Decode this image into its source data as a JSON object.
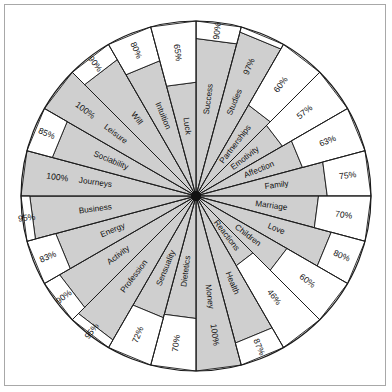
{
  "chart_data": {
    "type": "pie",
    "title": "",
    "subtitle": "",
    "xlabel": "",
    "ylabel": "",
    "grid": false,
    "legend": "none",
    "value_suffix": "%",
    "rmax": 100,
    "sector_count": 24,
    "start_angle_deg": -90,
    "direction": "clockwise",
    "fill_color": "#cfcfcf",
    "empty_color": "#ffffff",
    "line_color": "#1a1a1a",
    "categories": [
      "Success",
      "Studies",
      "Partnerships",
      "Emotivity",
      "Affection",
      "Family",
      "Marriage",
      "Love",
      "Children",
      "Reactions",
      "Health",
      "Money",
      "Dietetics",
      "Sensuality",
      "Profession",
      "Activity",
      "Energy",
      "Business",
      "Journeys",
      "Sociability",
      "Leisure",
      "Will",
      "Intuition",
      "Luck"
    ],
    "values": [
      90,
      97,
      60,
      57,
      63,
      75,
      70,
      80,
      60,
      46,
      87,
      100,
      70,
      72,
      95,
      90,
      83,
      95,
      100,
      85,
      100,
      90,
      80,
      65
    ],
    "labels": [
      "90%",
      "97%",
      "60%",
      "57%",
      "63%",
      "75%",
      "70%",
      "80%",
      "60%",
      "46%",
      "87%",
      "100%",
      "70%",
      "72%",
      "95%",
      "90%",
      "83%",
      "95%",
      "100%",
      "85%",
      "100%",
      "90%",
      "80%",
      "65%"
    ],
    "sectors": [
      {
        "name": "Success",
        "value": 90,
        "label": "90%"
      },
      {
        "name": "Studies",
        "value": 97,
        "label": "97%"
      },
      {
        "name": "Partnerships",
        "value": 60,
        "label": "60%"
      },
      {
        "name": "Emotivity",
        "value": 57,
        "label": "57%"
      },
      {
        "name": "Affection",
        "value": 63,
        "label": "63%"
      },
      {
        "name": "Family",
        "value": 75,
        "label": "75%"
      },
      {
        "name": "Marriage",
        "value": 70,
        "label": "70%"
      },
      {
        "name": "Love",
        "value": 80,
        "label": "80%"
      },
      {
        "name": "Children",
        "value": 60,
        "label": "60%"
      },
      {
        "name": "Reactions",
        "value": 46,
        "label": "46%"
      },
      {
        "name": "Health",
        "value": 87,
        "label": "87%"
      },
      {
        "name": "Money",
        "value": 100,
        "label": "100%"
      },
      {
        "name": "Dietetics",
        "value": 70,
        "label": "70%"
      },
      {
        "name": "Sensuality",
        "value": 72,
        "label": "72%"
      },
      {
        "name": "Profession",
        "value": 95,
        "label": "95%"
      },
      {
        "name": "Activity",
        "value": 90,
        "label": "90%"
      },
      {
        "name": "Energy",
        "value": 83,
        "label": "83%"
      },
      {
        "name": "Business",
        "value": 95,
        "label": "95%"
      },
      {
        "name": "Journeys",
        "value": 100,
        "label": "100%"
      },
      {
        "name": "Sociability",
        "value": 85,
        "label": "85%"
      },
      {
        "name": "Leisure",
        "value": 100,
        "label": "100%"
      },
      {
        "name": "Will",
        "value": 90,
        "label": "90%"
      },
      {
        "name": "Intuition",
        "value": 80,
        "label": "80%"
      },
      {
        "name": "Luck",
        "value": 65,
        "label": "65%"
      }
    ]
  }
}
